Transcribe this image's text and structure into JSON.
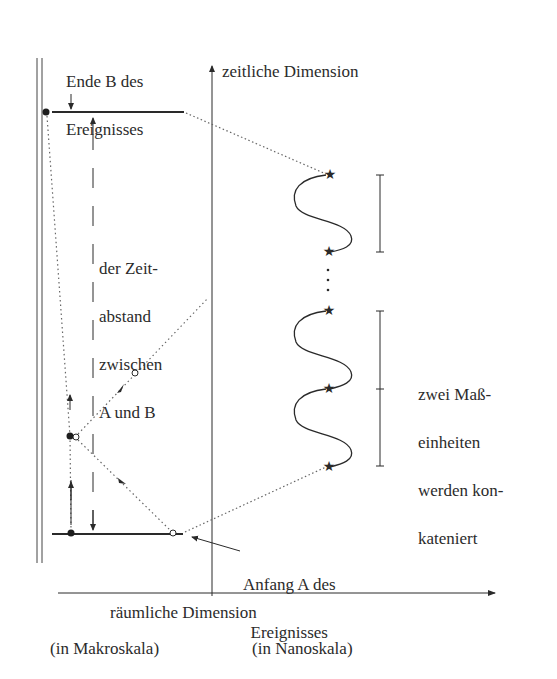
{
  "diagram": {
    "type": "measurement-of-time-interval",
    "labels": {
      "end_event": [
        "Ende B des",
        "Ereignisses"
      ],
      "time_axis": "zeitliche Dimension",
      "interval": [
        "der Zeit-",
        "abstand",
        "zwischen",
        "A und B"
      ],
      "concatenation": [
        "zwei Maß-",
        "einheiten",
        "werden kon-",
        "kateniert"
      ],
      "start_event": [
        "Anfang A des",
        "Ereignisses"
      ],
      "space_axis": "räumliche Dimension",
      "macro_scale": "(in Makroskala)",
      "nano_scale": "(in Nanoskala)"
    },
    "elements": {
      "double_wall_lines": 2,
      "event_markers": [
        "B (end, top)",
        "A (start, bottom)"
      ],
      "wave_segments": [
        "upper single unit",
        "lower two concatenated units"
      ],
      "star_markers": 5,
      "ellipsis": "⋮",
      "measure_brackets": [
        {
          "units": 1
        },
        {
          "units": 2
        }
      ]
    },
    "colors": {
      "ink": "#2a2a2a",
      "dotted": "#555555",
      "background": "#ffffff"
    }
  }
}
